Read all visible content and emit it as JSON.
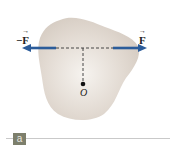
{
  "figure": {
    "labels": {
      "neg_force": {
        "sign": "−",
        "symbol": "F"
      },
      "force": {
        "symbol": "F"
      },
      "point": "O"
    },
    "panel_label": "a",
    "colors": {
      "body_fill": "#d8cfc6",
      "body_highlight": "#f6f3ef",
      "arrow": "#2b5c9a",
      "dashed_line": "#333333",
      "badge_bg": "#7d7f6c",
      "rule": "#c9c9c9"
    }
  }
}
